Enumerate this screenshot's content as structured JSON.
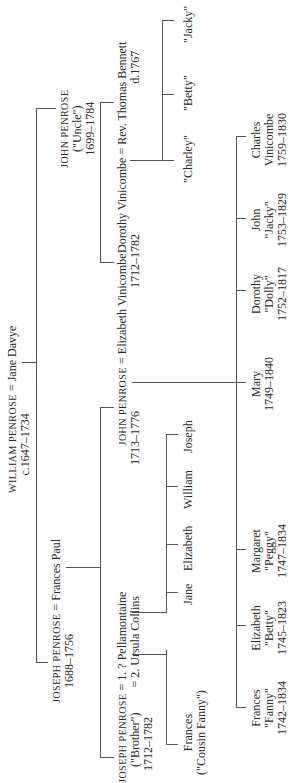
{
  "tree": {
    "gen1": {
      "william": {
        "name": "WILLIAM PENROSE",
        "dates": "c.1647–1734"
      },
      "eq": "=",
      "jane_davye": "Jane Davye"
    },
    "gen2": {
      "joseph": {
        "name": "JOSEPH PENROSE",
        "dates": "1688–1756"
      },
      "eq": "=",
      "frances_paul": "Frances Paul",
      "john_uncle": {
        "name": "JOHN PENROSE",
        "nick": "(\"Uncle\")",
        "dates": "1699–1784"
      }
    },
    "gen3": {
      "joseph_brother": {
        "name": "JOSEPH PENROSE",
        "nick": "(\"Brother\")",
        "dates": "1712–1782"
      },
      "eq1": "=",
      "wife1": "1. ? Pellamontaine",
      "eq2": "=",
      "wife2": "2. Ursula Collins",
      "john": {
        "name": "JOHN PENROSE",
        "dates": "1713–1776"
      },
      "eq3": "=",
      "elizabeth_vinicombe": {
        "name": "Elizabeth Vinicombe",
        "dates": "1712–1782"
      },
      "dorothy_vinicombe": "Dorothy Vinicombe",
      "eq4": "=",
      "thomas_bennett": {
        "name": "Rev. Thomas Bennett",
        "dates": "d.1767"
      }
    },
    "gen4": {
      "frances_cousin": {
        "name": "Frances",
        "nick": "(\"Cousin Fanny\")"
      },
      "ursula_children": [
        "Jane",
        "Elizabeth",
        "William",
        "Joseph"
      ],
      "bennett_children": [
        "\"Charley\"",
        "\"Betty\"",
        "\"Jacky\""
      ],
      "john_children": [
        {
          "name": "Frances",
          "nick": "\"Fanny\"",
          "dates": "1742–1834"
        },
        {
          "name": "Elizabeth",
          "nick": "\"Betty\"",
          "dates": "1745–1823"
        },
        {
          "name": "Margaret",
          "nick": "\"Peggy\"",
          "dates": "1747–1834"
        },
        {
          "name": "Mary",
          "nick": "",
          "dates": "1749–1840"
        },
        {
          "name": "Dorothy",
          "nick": "\"Dolly\"",
          "dates": "1752–1817"
        },
        {
          "name": "John",
          "nick": "\"Jacky\"",
          "dates": "1753–1829"
        },
        {
          "name": "Charles",
          "nick": "Vinicombe",
          "dates": "1759–1830"
        }
      ]
    }
  }
}
